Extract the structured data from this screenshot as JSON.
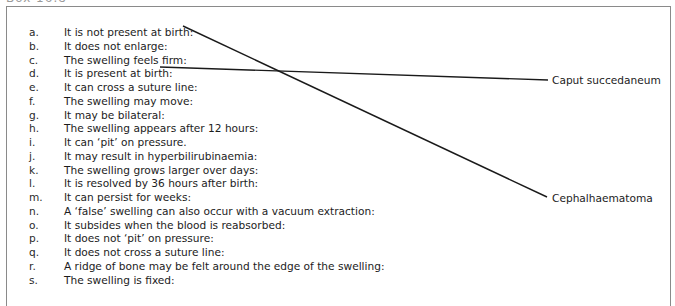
{
  "exercise": {
    "heading_fragment": "Box 16.8",
    "items": [
      {
        "letter": "a.",
        "text": "It is not present at birth:"
      },
      {
        "letter": "b.",
        "text": "It does not enlarge:"
      },
      {
        "letter": "c.",
        "text": "The swelling feels firm:"
      },
      {
        "letter": "d.",
        "text": "It is present at birth:"
      },
      {
        "letter": "e.",
        "text": "It can cross a suture line:"
      },
      {
        "letter": "f.",
        "text": "The swelling may move:"
      },
      {
        "letter": "g.",
        "text": "It may be bilateral:"
      },
      {
        "letter": "h.",
        "text": "The swelling appears after 12 hours:"
      },
      {
        "letter": "i.",
        "text": "It can ‘pit’ on pressure."
      },
      {
        "letter": "j.",
        "text": "It may result in hyperbilirubinaemia:"
      },
      {
        "letter": "k.",
        "text": "The swelling grows larger over days:"
      },
      {
        "letter": "l.",
        "text": "It is resolved by 36 hours after birth:"
      },
      {
        "letter": "m.",
        "text": "It can persist for weeks:"
      },
      {
        "letter": "n.",
        "text": "A ‘false’ swelling can also occur with a vacuum extraction:"
      },
      {
        "letter": "o.",
        "text": "It subsides when the blood is reabsorbed:"
      },
      {
        "letter": "p.",
        "text": "It does not ‘pit’ on pressure:"
      },
      {
        "letter": "q.",
        "text": "It does not cross a suture line:"
      },
      {
        "letter": "r.",
        "text": "A ridge of bone may be felt around the edge of the swelling:"
      },
      {
        "letter": "s.",
        "text": "The swelling is fixed:"
      }
    ],
    "targets": [
      {
        "label": "Caput succedaneum"
      },
      {
        "label": "Cephalhaematoma"
      }
    ],
    "connections": [
      {
        "from": "a.",
        "to": "Cephalhaematoma"
      },
      {
        "from": "d.",
        "to": "Caput succedaneum"
      }
    ],
    "colors": {
      "border": "#8a8a8a",
      "line": "#1a1a1a",
      "text": "#1c1c1c"
    }
  }
}
